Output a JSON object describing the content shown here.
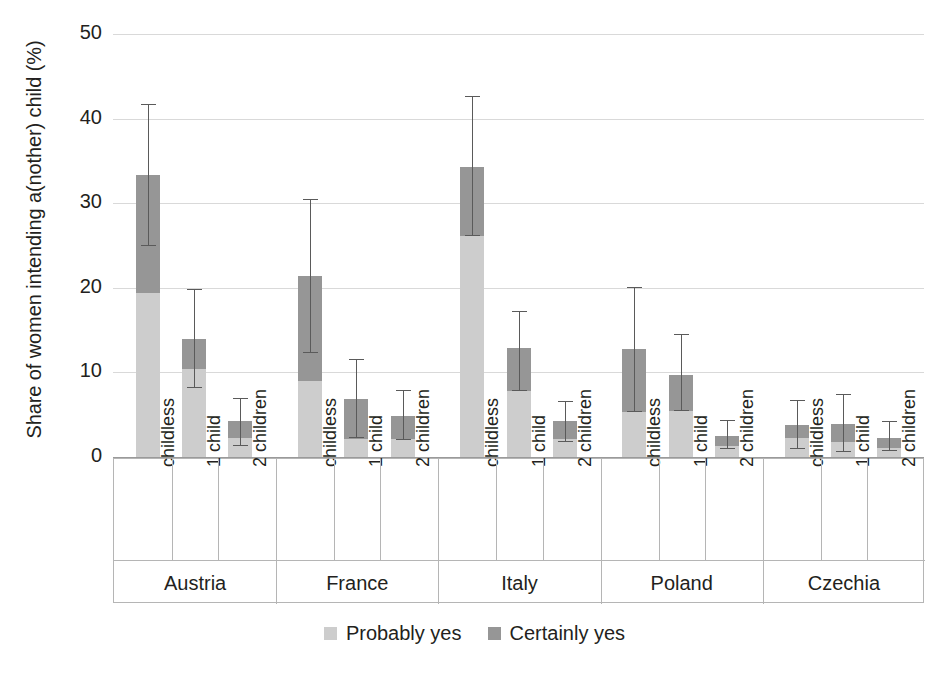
{
  "chart_data": {
    "type": "bar",
    "subtype": "stacked-bar-with-error-bars",
    "title": "",
    "xlabel": "",
    "ylabel": "Share of women intending a(nother) child (%)",
    "ylim": [
      0,
      50
    ],
    "yticks": [
      0,
      10,
      20,
      30,
      40,
      50
    ],
    "ytick_labels": [
      "0",
      "10",
      "20",
      "30",
      "40",
      "50"
    ],
    "grid": "horizontal",
    "legend_position": "bottom-center",
    "legend": [
      {
        "label": "Probably yes",
        "color": "#cdcdcd"
      },
      {
        "label": "Certainly yes",
        "color": "#969696"
      }
    ],
    "series": [
      {
        "name": "Probably yes",
        "color": "#cdcdcd"
      },
      {
        "name": "Certainly yes",
        "color": "#969696"
      }
    ],
    "groups": [
      "Austria",
      "France",
      "Italy",
      "Poland",
      "Czechia"
    ],
    "categories": [
      "childless",
      "1 child",
      "2 children"
    ],
    "bars": [
      {
        "group": "Austria",
        "items": [
          {
            "category": "childless",
            "probably_yes": 19.4,
            "certainly_yes": 13.9,
            "total": 33.3,
            "ci_low": 24.9,
            "ci_high": 41.7
          },
          {
            "category": "1 child",
            "probably_yes": 10.4,
            "certainly_yes": 3.6,
            "total": 14.0,
            "ci_low": 8.2,
            "ci_high": 19.8
          },
          {
            "category": "2 children",
            "probably_yes": 2.2,
            "certainly_yes": 2.0,
            "total": 4.2,
            "ci_low": 1.3,
            "ci_high": 7.0
          }
        ]
      },
      {
        "group": "France",
        "items": [
          {
            "category": "childless",
            "probably_yes": 9.0,
            "certainly_yes": 12.4,
            "total": 21.4,
            "ci_low": 12.3,
            "ci_high": 30.5
          },
          {
            "category": "1 child",
            "probably_yes": 2.1,
            "certainly_yes": 4.8,
            "total": 6.9,
            "ci_low": 2.2,
            "ci_high": 11.6
          },
          {
            "category": "2 children",
            "probably_yes": 2.1,
            "certainly_yes": 2.8,
            "total": 4.9,
            "ci_low": 2.0,
            "ci_high": 7.9
          }
        ]
      },
      {
        "group": "Italy",
        "items": [
          {
            "category": "childless",
            "probably_yes": 26.1,
            "certainly_yes": 8.2,
            "total": 34.3,
            "ci_low": 26.1,
            "ci_high": 42.7
          },
          {
            "category": "1 child",
            "probably_yes": 7.8,
            "certainly_yes": 5.1,
            "total": 12.9,
            "ci_low": 7.8,
            "ci_high": 17.2
          },
          {
            "category": "2 children",
            "probably_yes": 2.1,
            "certainly_yes": 2.1,
            "total": 4.2,
            "ci_low": 1.8,
            "ci_high": 6.6
          }
        ]
      },
      {
        "group": "Poland",
        "items": [
          {
            "category": "childless",
            "probably_yes": 5.3,
            "certainly_yes": 7.5,
            "total": 12.8,
            "ci_low": 5.3,
            "ci_high": 20.1
          },
          {
            "category": "1 child",
            "probably_yes": 5.4,
            "certainly_yes": 4.3,
            "total": 9.7,
            "ci_low": 5.4,
            "ci_high": 14.5
          },
          {
            "category": "2 children",
            "probably_yes": 1.3,
            "certainly_yes": 1.2,
            "total": 2.5,
            "ci_low": 1.0,
            "ci_high": 4.4
          }
        ]
      },
      {
        "group": "Czechia",
        "items": [
          {
            "category": "childless",
            "probably_yes": 2.2,
            "certainly_yes": 1.6,
            "total": 3.8,
            "ci_low": 0.9,
            "ci_high": 6.7
          },
          {
            "category": "1 child",
            "probably_yes": 1.8,
            "certainly_yes": 2.1,
            "total": 3.9,
            "ci_low": 0.6,
            "ci_high": 7.4
          },
          {
            "category": "2 children",
            "probably_yes": 1.1,
            "certainly_yes": 1.1,
            "total": 2.2,
            "ci_low": 0.7,
            "ci_high": 4.2
          }
        ]
      }
    ]
  },
  "axis": {
    "y_title": "Share of women intending a(nother) child (%)"
  }
}
